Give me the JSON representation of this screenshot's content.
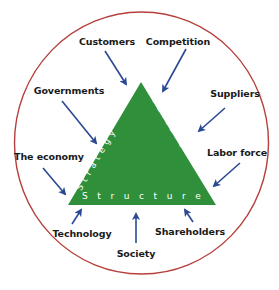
{
  "diagram": {
    "colors": {
      "circle_stroke": "#b5403c",
      "triangle_fill": "#2f8f3a",
      "arrow": "#2b4894",
      "label_text": "#1a1a1a",
      "edge_text": "#ffffff"
    },
    "triangle": {
      "left_edge_label": "Strategy",
      "right_edge_label": "Culture",
      "base_label": "Structure"
    },
    "external_forces": [
      {
        "id": "customers",
        "label": "Customers"
      },
      {
        "id": "competition",
        "label": "Competition"
      },
      {
        "id": "governments",
        "label": "Governments"
      },
      {
        "id": "suppliers",
        "label": "Suppliers"
      },
      {
        "id": "the-economy",
        "label": "The economy"
      },
      {
        "id": "labor-force",
        "label": "Labor force"
      },
      {
        "id": "technology",
        "label": "Technology"
      },
      {
        "id": "shareholders",
        "label": "Shareholders"
      },
      {
        "id": "society",
        "label": "Society"
      }
    ]
  }
}
